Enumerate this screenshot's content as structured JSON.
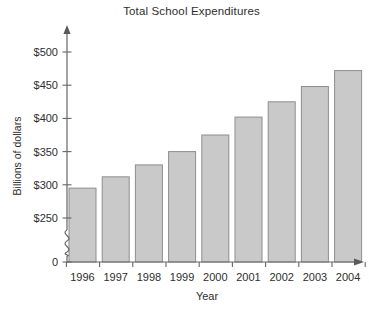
{
  "chart_data": {
    "type": "bar",
    "title": "Total School Expenditures",
    "xlabel": "Year",
    "ylabel": "Billions of dollars",
    "categories": [
      "1996",
      "1997",
      "1998",
      "1999",
      "2000",
      "2001",
      "2002",
      "2003",
      "2004"
    ],
    "values": [
      295,
      312,
      330,
      350,
      375,
      402,
      425,
      448,
      472
    ],
    "ytick_labels": [
      "$500",
      "$450",
      "$400",
      "$350",
      "$300",
      "$250",
      "0"
    ],
    "ytick_values": [
      500,
      450,
      400,
      350,
      300,
      250,
      0
    ],
    "ylim": [
      250,
      500
    ],
    "axis_break": true,
    "axis_break_note": "y-axis broken between 0 and $250",
    "grid": false,
    "legend": false,
    "bar_fill_color": "#c9c9c9",
    "bar_border_color": "#8e8e8e",
    "axis_color": "#666666",
    "text_color": "#2e2e2e",
    "background_color": "#ffffff"
  }
}
